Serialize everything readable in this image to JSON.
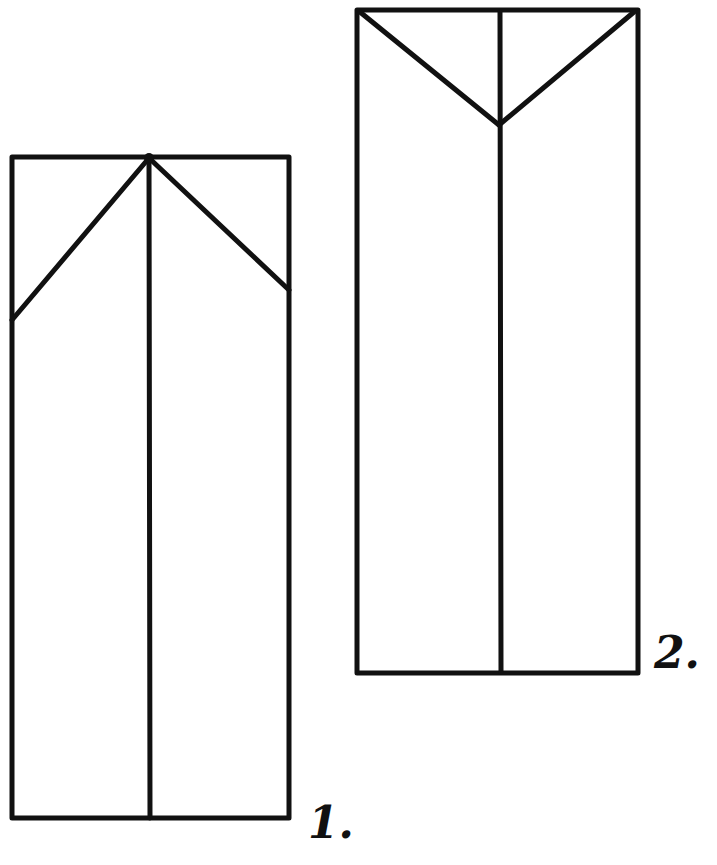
{
  "diagram": {
    "type": "origami-folding-steps",
    "ink_color": "#111111",
    "background": "#ffffff",
    "steps": [
      {
        "label": "1.",
        "description": "Rectangle with vertical center crease; top corners folded down toward the center top point",
        "rect": {
          "x": 12,
          "y": 157,
          "w": 277,
          "h": 661
        },
        "center_line_x": 149,
        "diagonals": [
          {
            "x1": 149,
            "y1": 158,
            "x2": 12,
            "y2": 320
          },
          {
            "x1": 149,
            "y1": 158,
            "x2": 289,
            "y2": 290
          }
        ]
      },
      {
        "label": "2.",
        "description": "Rectangle with vertical center crease; V-shaped fold lines from top corners meeting at the center",
        "rect": {
          "x": 357,
          "y": 10,
          "w": 281,
          "h": 663
        },
        "center_line_x": 500,
        "diagonals": [
          {
            "x1": 360,
            "y1": 12,
            "x2": 499,
            "y2": 125
          },
          {
            "x1": 634,
            "y1": 12,
            "x2": 499,
            "y2": 125
          }
        ]
      }
    ]
  }
}
